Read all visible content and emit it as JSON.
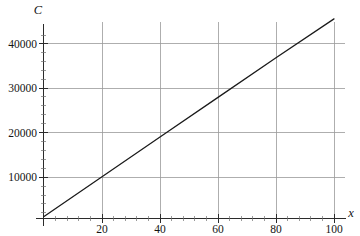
{
  "chart_data": {
    "type": "line",
    "title": "",
    "subtitle": "",
    "xlabel": "x",
    "ylabel": "C",
    "xlim": [
      -2,
      106
    ],
    "ylim": [
      -600,
      48000
    ],
    "grid": true,
    "legend": false,
    "legend_position": "none",
    "x_ticks": [
      20,
      40,
      60,
      80,
      100
    ],
    "x_tick_labels": [
      "20",
      "40",
      "60",
      "80",
      "100"
    ],
    "x_minor_tick_step": 4,
    "y_ticks": [
      10000,
      20000,
      30000,
      40000
    ],
    "y_tick_labels": [
      "10000",
      "20000",
      "30000",
      "40000"
    ],
    "y_minor_tick_step": 2000,
    "series": [
      {
        "name": "C(x)",
        "color": "#1a1a1a",
        "x": [
          0,
          20,
          40,
          60,
          80,
          100
        ],
        "values": [
          1200,
          10100,
          19000,
          27900,
          36800,
          45500
        ]
      }
    ],
    "annotations": []
  },
  "axis_labels": {
    "y_axis_symbol": "C",
    "x_axis_symbol": "x"
  },
  "colors": {
    "background": "#ffffff",
    "grid": "#9a9a9a",
    "axis": "#2b2b2b",
    "series": "#1a1a1a",
    "text": "#141414"
  }
}
